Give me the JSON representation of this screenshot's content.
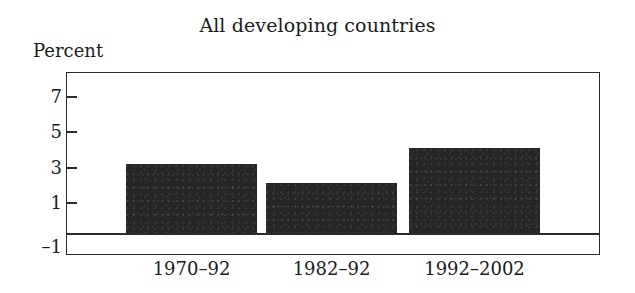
{
  "chart_data": {
    "type": "bar",
    "title": "All developing countries",
    "xlabel": "",
    "ylabel": "Percent",
    "categories": [
      "1970–92",
      "1982–92",
      "1992–2002"
    ],
    "values": [
      3.9,
      2.8,
      4.8
    ],
    "series": [
      {
        "name": "GDP growth",
        "values": [
          3.9,
          2.8,
          4.8
        ]
      }
    ],
    "ylim": [
      -1,
      8
    ],
    "yticks": [
      -1,
      1,
      3,
      5,
      7
    ],
    "ytick_labels": [
      "–1",
      "1",
      "3",
      "5",
      "7"
    ],
    "grid": false,
    "legend": false,
    "legend_position": "none",
    "bar_color": "#262626",
    "frame_color": "#2b2b2b",
    "background_color": "#ffffff",
    "zero_line": 0
  }
}
